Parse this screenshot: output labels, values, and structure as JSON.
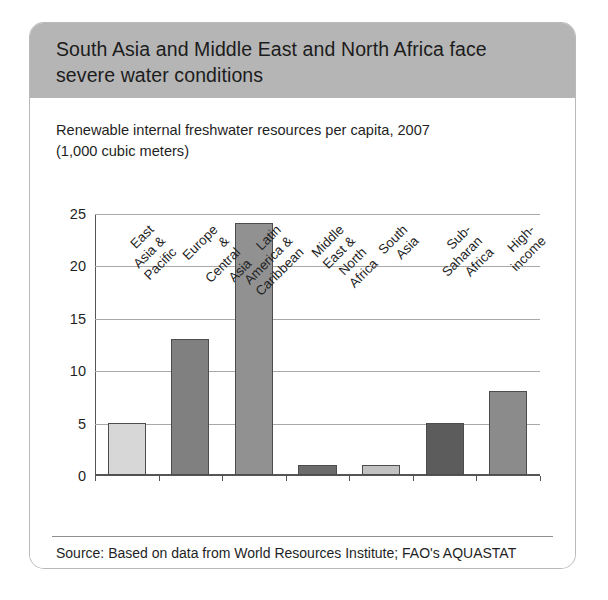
{
  "card": {
    "title": "South Asia and Middle East and North Africa face\nsevere water conditions",
    "header_bg": "#b5b5b5",
    "body_bg": "#ffffff",
    "border_color": "#b9b9b9"
  },
  "chart_data": {
    "type": "bar",
    "title": "Renewable internal freshwater resources per capita, 2007\n(1,000 cubic meters)",
    "subtitle_line1": "Renewable internal freshwater resources per capita, 2007",
    "subtitle_line2": "(1,000 cubic meters)",
    "xlabel": "",
    "ylabel": "",
    "ylim": [
      0,
      25
    ],
    "ytick_values": [
      0,
      5,
      10,
      15,
      20,
      25
    ],
    "ytick_labels": [
      "0",
      "5",
      "10",
      "15",
      "20",
      "25"
    ],
    "grid": true,
    "legend": "none",
    "categories": [
      "East Asia &\nPacific",
      "Europe &\nCentral Asia",
      "Latin America &\nCaribbean",
      "Middle East &\nNorth Africa",
      "South Asia",
      "Sub-Saharan Africa",
      "High-income"
    ],
    "values": [
      5,
      13,
      24,
      1,
      1,
      5,
      8
    ],
    "bar_colors": [
      "#d7d7d7",
      "#808080",
      "#919191",
      "#6b6b6b",
      "#c2c2c2",
      "#5c5c5c",
      "#8b8b8b"
    ],
    "bar_edge_color": "#4c4c4c",
    "gridline_color": "#a8a8a8",
    "axis_color": "#555555"
  },
  "source": {
    "text": "Source: Based on data from World Resources Institute; FAO's AQUASTAT"
  }
}
